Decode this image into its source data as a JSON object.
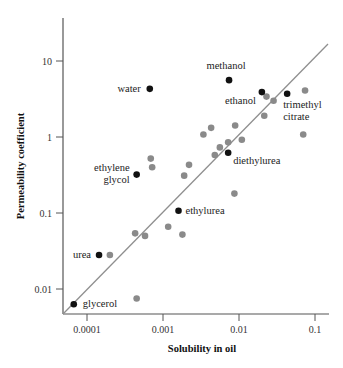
{
  "chart_data": {
    "type": "scatter",
    "title": "",
    "xlabel": "Solubility in oil",
    "ylabel": "Permeability coefficient",
    "xscale": "log",
    "yscale": "log",
    "xlim": [
      7e-05,
      0.12
    ],
    "ylim": [
      0.005,
      40
    ],
    "x_ticks": [
      0.0001,
      0.001,
      0.01,
      0.1
    ],
    "x_tick_labels": [
      "0.0001",
      "0.001",
      "0.01",
      "0.1"
    ],
    "y_ticks": [
      0.01,
      0.1,
      1,
      10
    ],
    "y_tick_labels": [
      "0.01",
      "0.1",
      "1",
      "10"
    ],
    "grid": false,
    "legend": null,
    "trend_line": {
      "description": "diagonal reference line",
      "from": [
        5.5e-05,
        0.0055
      ],
      "to": [
        0.126,
        23
      ]
    },
    "series": [
      {
        "name": "labeled compounds",
        "color": "#111111",
        "points": [
          {
            "label": "water",
            "x": 0.00067,
            "y": 4.3,
            "label_lines": [
              "water"
            ]
          },
          {
            "label": "methanol",
            "x": 0.0074,
            "y": 5.6,
            "label_lines": [
              "methanol"
            ]
          },
          {
            "label": "ethanol",
            "x": 0.02,
            "y": 3.9,
            "label_lines": [
              "ethanol"
            ]
          },
          {
            "label": "trimethyl citrate",
            "x": 0.043,
            "y": 3.7,
            "label_lines": [
              "trimethyl",
              "citrate"
            ]
          },
          {
            "label": "ethylene glycol",
            "x": 0.00045,
            "y": 0.32,
            "label_lines": [
              "ethylene",
              "glycol"
            ]
          },
          {
            "label": "diethylurea",
            "x": 0.0072,
            "y": 0.62,
            "label_lines": [
              "diethylurea"
            ]
          },
          {
            "label": "ethylurea",
            "x": 0.0016,
            "y": 0.107,
            "label_lines": [
              "ethylurea"
            ]
          },
          {
            "label": "urea",
            "x": 0.000144,
            "y": 0.028,
            "label_lines": [
              "urea"
            ]
          },
          {
            "label": "glycerol",
            "x": 6.7e-05,
            "y": 0.0063,
            "label_lines": [
              "glycerol"
            ]
          }
        ]
      },
      {
        "name": "other compounds",
        "color": "#8a8a8a",
        "points": [
          {
            "x": 0.00069,
            "y": 0.52
          },
          {
            "x": 0.00072,
            "y": 0.4
          },
          {
            "x": 0.0002,
            "y": 0.028
          },
          {
            "x": 0.00045,
            "y": 0.0075
          },
          {
            "x": 0.00043,
            "y": 0.054
          },
          {
            "x": 0.00058,
            "y": 0.05
          },
          {
            "x": 0.00117,
            "y": 0.066
          },
          {
            "x": 0.0018,
            "y": 0.052
          },
          {
            "x": 0.0022,
            "y": 0.43
          },
          {
            "x": 0.0019,
            "y": 0.31
          },
          {
            "x": 0.0034,
            "y": 1.08
          },
          {
            "x": 0.0043,
            "y": 1.32
          },
          {
            "x": 0.0048,
            "y": 0.58
          },
          {
            "x": 0.0056,
            "y": 0.73
          },
          {
            "x": 0.0072,
            "y": 0.85
          },
          {
            "x": 0.0089,
            "y": 1.42
          },
          {
            "x": 0.0109,
            "y": 0.92
          },
          {
            "x": 0.0087,
            "y": 0.18
          },
          {
            "x": 0.023,
            "y": 3.4
          },
          {
            "x": 0.0285,
            "y": 3.0
          },
          {
            "x": 0.0215,
            "y": 1.9
          },
          {
            "x": 0.074,
            "y": 4.1
          },
          {
            "x": 0.07,
            "y": 1.08
          }
        ]
      }
    ]
  }
}
